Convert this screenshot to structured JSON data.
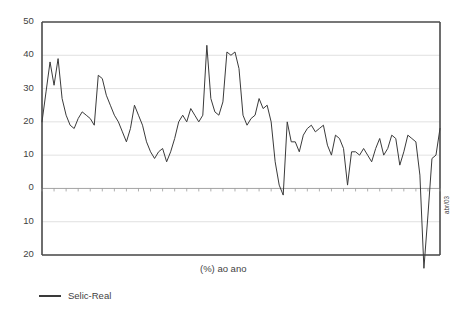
{
  "chart_data": {
    "type": "line",
    "title": "",
    "xlabel": "(%) ao ano",
    "ylabel": "",
    "ylim": [
      -20,
      50
    ],
    "ytick_labels": [
      "50",
      "40",
      "30",
      "20",
      "10",
      "0",
      "10",
      "20"
    ],
    "ytick_values": [
      50,
      40,
      30,
      20,
      10,
      0,
      -10,
      -20
    ],
    "grid": true,
    "legend_position": "bottom-left",
    "legend": [
      "Selic-Real"
    ],
    "xtick_labels": [
      "jan/95",
      "abr/95",
      "jul/95",
      "out/95",
      "jan/96",
      "abr/96",
      "jul/96",
      "out/96",
      "jan/97",
      "abr/97",
      "jul/97",
      "out/97",
      "jan/98",
      "abr/98",
      "jul/98",
      "out/98",
      "jan/99",
      "abr/99",
      "jul/99",
      "out/99",
      "jan/00",
      "abr/00",
      "jul/00",
      "out/00",
      "jan/01",
      "abr/01",
      "jul/01",
      "out/01",
      "jan/02",
      "abr/02",
      "jul/02",
      "out/02",
      "jan/03",
      "abr/03"
    ],
    "x": [
      "jan/95",
      "fev/95",
      "mar/95",
      "abr/95",
      "mai/95",
      "jun/95",
      "jul/95",
      "ago/95",
      "set/95",
      "out/95",
      "nov/95",
      "dez/95",
      "jan/96",
      "fev/96",
      "mar/96",
      "abr/96",
      "mai/96",
      "jun/96",
      "jul/96",
      "ago/96",
      "set/96",
      "out/96",
      "nov/96",
      "dez/96",
      "jan/97",
      "fev/97",
      "mar/97",
      "abr/97",
      "mai/97",
      "jun/97",
      "jul/97",
      "ago/97",
      "set/97",
      "out/97",
      "nov/97",
      "dez/97",
      "jan/98",
      "fev/98",
      "mar/98",
      "abr/98",
      "mai/98",
      "jun/98",
      "jul/98",
      "ago/98",
      "set/98",
      "out/98",
      "nov/98",
      "dez/98",
      "jan/99",
      "fev/99",
      "mar/99",
      "abr/99",
      "mai/99",
      "jun/99",
      "jul/99",
      "ago/99",
      "set/99",
      "out/99",
      "nov/99",
      "dez/99",
      "jan/00",
      "fev/00",
      "mar/00",
      "abr/00",
      "mai/00",
      "jun/00",
      "jul/00",
      "ago/00",
      "set/00",
      "out/00",
      "nov/00",
      "dez/00",
      "jan/01",
      "fev/01",
      "mar/01",
      "abr/01",
      "mai/01",
      "jun/01",
      "jul/01",
      "ago/01",
      "set/01",
      "out/01",
      "nov/01",
      "dez/01",
      "jan/02",
      "fev/02",
      "mar/02",
      "abr/02",
      "mai/02",
      "jun/02",
      "jul/02",
      "ago/02",
      "set/02",
      "out/02",
      "nov/02",
      "dez/02",
      "jan/03",
      "fev/03",
      "mar/03",
      "abr/03"
    ],
    "series": [
      {
        "name": "Selic-Real",
        "color": "#3a3a3a",
        "values": [
          20,
          29,
          38,
          31,
          39,
          27,
          22,
          19,
          18,
          21,
          23,
          22,
          21,
          19,
          34,
          33,
          28,
          25,
          22,
          20,
          17,
          14,
          18,
          25,
          22,
          19,
          14,
          11,
          9,
          11,
          12,
          8,
          11,
          15,
          20,
          22,
          20,
          24,
          22,
          20,
          22,
          43,
          27,
          23,
          22,
          26,
          41,
          40,
          41,
          36,
          22,
          19,
          21,
          22,
          27,
          24,
          25,
          20,
          8,
          1,
          -2,
          20,
          14,
          14,
          11,
          16,
          18,
          19,
          17,
          18,
          19,
          13,
          10,
          16,
          15,
          12,
          1,
          11,
          11,
          10,
          12,
          10,
          8,
          12,
          15,
          10,
          12,
          16,
          15,
          7,
          11,
          16,
          15,
          14,
          4,
          -24,
          -8,
          9,
          10,
          18
        ]
      }
    ]
  },
  "axis": {
    "x_title": "(%) ao ano"
  },
  "legend": {
    "items": [
      {
        "label": "Selic-Real",
        "color": "#3a3a3a"
      }
    ]
  }
}
